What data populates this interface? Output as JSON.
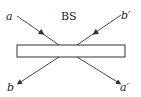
{
  "diagram": {
    "element_label": "BS",
    "ports": {
      "input_a": "a",
      "input_b_prime": "b′",
      "output_b": "b",
      "output_a_prime": "a′"
    },
    "colors": {
      "line": "#333333",
      "background": "#ffffff"
    }
  }
}
